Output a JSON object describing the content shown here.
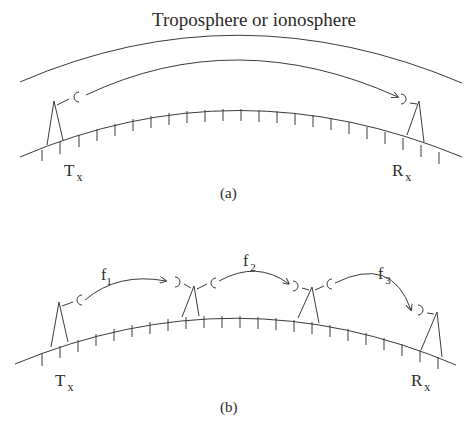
{
  "figure": {
    "panel_a": {
      "layer_label": "Troposphere or ionosphere",
      "transmitter": {
        "main": "T",
        "sub": "x"
      },
      "receiver": {
        "main": "R",
        "sub": "x"
      },
      "caption": "(a)"
    },
    "panel_b": {
      "transmitter": {
        "main": "T",
        "sub": "x"
      },
      "receiver": {
        "main": "R",
        "sub": "x"
      },
      "hops": [
        {
          "main": "f",
          "sub": "1"
        },
        {
          "main": "f",
          "sub": "2"
        },
        {
          "main": "f",
          "sub": "3"
        }
      ],
      "caption": "(b)"
    }
  },
  "colors": {
    "line": "#3a3a3a",
    "text": "#2a2a2a",
    "background": "#ffffff"
  }
}
